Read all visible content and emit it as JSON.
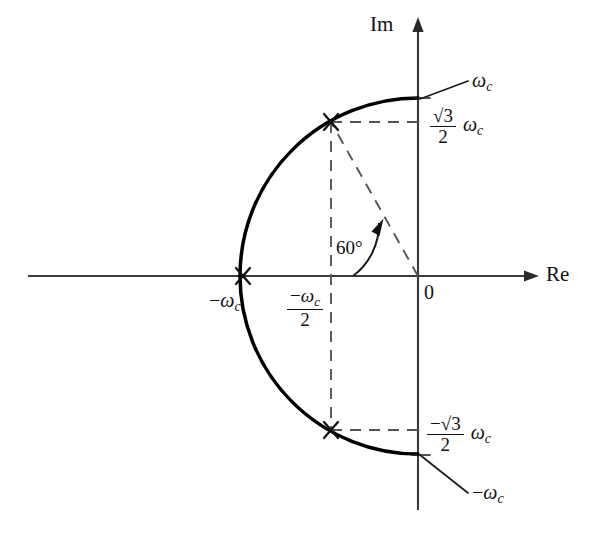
{
  "figure": {
    "type": "complex-plane-pole-diagram",
    "axes": {
      "real_label": "Re",
      "imag_label": "Im",
      "origin_label": "0"
    },
    "labels": {
      "top_right_omega": {
        "text": "ω",
        "sub": "c"
      },
      "top_fraction": {
        "num": "√3",
        "den": "2",
        "suffix": "ω",
        "suffix_sub": "c"
      },
      "left_omega": {
        "sign": "−",
        "text": "ω",
        "sub": "c"
      },
      "left_half_fraction": {
        "num_sign": "−",
        "num": "ω",
        "num_sub": "c",
        "den": "2"
      },
      "bottom_fraction": {
        "num": "−√3",
        "den": "2",
        "suffix": "ω",
        "suffix_sub": "c"
      },
      "bottom_right_omega": {
        "sign": "−",
        "text": "ω",
        "sub": "c"
      },
      "angle": "60°"
    },
    "geometry": {
      "origin": {
        "x": 418,
        "y": 276
      },
      "radius": 178,
      "arc_start_deg": 90,
      "arc_end_deg": 270,
      "pole_marks_deg": [
        120,
        240
      ],
      "re_axis": {
        "x1": 28,
        "x2": 533
      },
      "im_axis": {
        "y1": 22,
        "y2": 510
      }
    },
    "colors": {
      "ink": "#1a1a1a",
      "arc": "#000000",
      "axis": "#3a3a3a",
      "dash": "#555555",
      "background": "#ffffff"
    }
  }
}
